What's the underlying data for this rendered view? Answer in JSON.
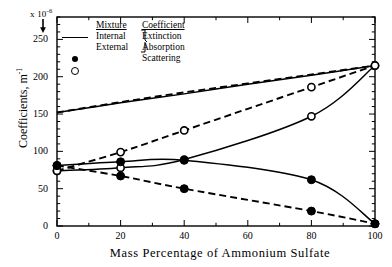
{
  "axis_multiplier": {
    "prefix": "x 10",
    "exponent": "-6",
    "arrow": "down-arrow-icon"
  },
  "y_axis": {
    "title_main": "Coefficients,  m",
    "title_sup": "-1",
    "ticks": [
      0,
      50,
      100,
      150,
      200,
      250
    ],
    "min": 0,
    "max": 280
  },
  "x_axis": {
    "title": "Mass Percentage of Ammonium Sulfate",
    "ticks": [
      0,
      20,
      40,
      60,
      80,
      100
    ],
    "min": 0,
    "max": 100
  },
  "legend": {
    "header_mixture": "Mixture",
    "header_coefficient": "Coefficient",
    "rows": [
      {
        "symbol": "solid-line",
        "mixture": "Internal",
        "coefficient": "Extinction"
      },
      {
        "symbol": "dashed-line",
        "mixture": "External",
        "coefficient": "Absorption"
      },
      {
        "symbol": "filled-circle",
        "mixture": "",
        "coefficient": "Scattering"
      },
      {
        "symbol": "open-circle",
        "mixture": "",
        "coefficient": ""
      }
    ],
    "brace": "}"
  },
  "chart_data": {
    "type": "line",
    "title": "",
    "xlabel": "Mass Percentage of Ammonium Sulfate",
    "ylabel": "Coefficients,  m^-1",
    "multiplier": "x 10^-6",
    "xlim": [
      0,
      100
    ],
    "ylim": [
      0,
      280
    ],
    "xticks": [
      0,
      20,
      40,
      60,
      80,
      100
    ],
    "yticks": [
      0,
      50,
      100,
      150,
      200,
      250
    ],
    "grid": false,
    "legend_position": "top-center",
    "series": [
      {
        "name": "Internal Extinction",
        "mixture": "Internal",
        "coefficient": "Extinction",
        "style": "solid",
        "marker": "none",
        "x": [
          0,
          20,
          40,
          60,
          80,
          100
        ],
        "values": [
          152,
          165,
          177,
          190,
          202,
          215
        ]
      },
      {
        "name": "External Extinction",
        "mixture": "External",
        "coefficient": "Extinction",
        "style": "dashed",
        "marker": "none",
        "x": [
          0,
          20,
          40,
          60,
          80,
          100
        ],
        "values": [
          152,
          166,
          179,
          191,
          203,
          215
        ]
      },
      {
        "name": "Internal Scattering",
        "mixture": "Internal",
        "coefficient": "Scattering",
        "style": "solid",
        "marker": "open-circle",
        "x": [
          0,
          20,
          40,
          80,
          100
        ],
        "values": [
          74,
          78,
          89,
          147,
          215
        ]
      },
      {
        "name": "External Scattering",
        "mixture": "External",
        "coefficient": "Scattering",
        "style": "dashed",
        "marker": "open-circle",
        "x": [
          0,
          20,
          40,
          80,
          100
        ],
        "values": [
          74,
          99,
          128,
          186,
          215
        ]
      },
      {
        "name": "Internal Absorption",
        "mixture": "Internal",
        "coefficient": "Absorption",
        "style": "solid",
        "marker": "filled-circle",
        "x": [
          0,
          20,
          40,
          80,
          100
        ],
        "values": [
          81,
          86,
          88,
          62,
          3
        ]
      },
      {
        "name": "External Absorption",
        "mixture": "External",
        "coefficient": "Absorption",
        "style": "dashed",
        "marker": "filled-circle",
        "x": [
          0,
          20,
          40,
          80,
          100
        ],
        "values": [
          81,
          67,
          50,
          20,
          3
        ]
      }
    ]
  }
}
